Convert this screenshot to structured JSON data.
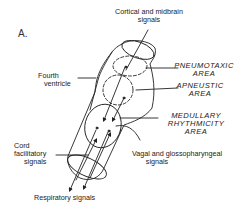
{
  "figure": {
    "panel_label": "A.",
    "colors": {
      "stroke": "#222222",
      "background": "#ffffff"
    }
  },
  "labels": {
    "cortical": {
      "line1": "Cortical and midbrain",
      "line2": "signals"
    },
    "fourth_ventricle": {
      "line1": "Fourth",
      "line2": "ventricle"
    },
    "pneumotaxic": {
      "line1": "PNEUMOTAXIC",
      "line2": "AREA"
    },
    "apneustic": {
      "line1": "APNEUSTIC",
      "line2": "AREA"
    },
    "medullary": {
      "line1": "MEDULLARY",
      "line2": "RHYTHMICITY",
      "line3": "AREA"
    },
    "cord": {
      "line1": "Cord",
      "line2": "facilitatory",
      "line3": "signals"
    },
    "vagal": {
      "line1": "Vagal and glossopharyngeal",
      "line2": "signals"
    },
    "respiratory": {
      "line1": "Respiratory signals"
    }
  }
}
